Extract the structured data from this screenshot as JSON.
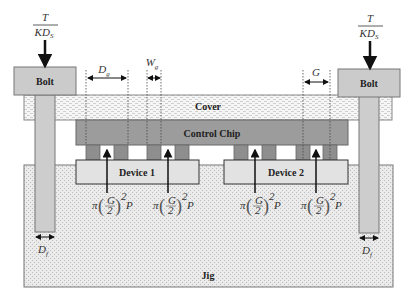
{
  "labels": {
    "bolt_left": "Bolt",
    "bolt_right": "Bolt",
    "cover": "Cover",
    "control_chip": "Control Chip",
    "device1": "Device 1",
    "device2": "Device 2",
    "jig": "Jig"
  },
  "dimensions": {
    "force_num": "T",
    "force_den": "KD",
    "force_den_sub": "S",
    "Dg": "D",
    "Dg_sub": "g",
    "Wg": "W",
    "Wg_sub": "g",
    "G": "G",
    "Df": "D",
    "Df_sub": "f"
  },
  "pressure_formula": {
    "pi": "π",
    "num": "G",
    "den": "2",
    "exp": "2",
    "P": "P"
  },
  "colors": {
    "bolt": "#c8c8c8",
    "cover": "#f2f2f2",
    "chip": "#9a9a9a",
    "bump": "#8c8c8c",
    "device": "#e2e2e2",
    "jig": "#e8e8e8"
  }
}
